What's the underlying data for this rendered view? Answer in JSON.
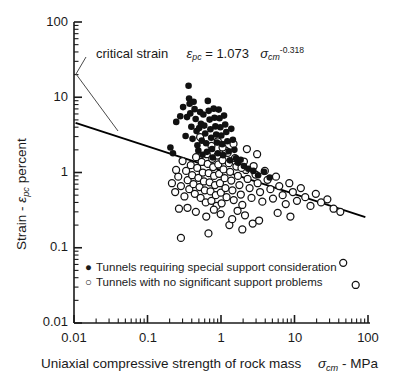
{
  "chart_data": {
    "type": "scatter",
    "title": "",
    "xlabel_parts": {
      "pre": "Uniaxial compressive strength of rock mass",
      "sym": "σ",
      "sub": "cm",
      "post": "- MPa"
    },
    "ylabel_parts": {
      "pre": "Strain -",
      "sym": "ε",
      "sub": "pc",
      "post": "percent"
    },
    "xscale": "log",
    "yscale": "log",
    "xlim": [
      0.01,
      100
    ],
    "ylim": [
      0.01,
      100
    ],
    "xticks": [
      0.01,
      0.1,
      1,
      10,
      100
    ],
    "xticklabels": [
      "0.01",
      "0.1",
      "1",
      "10",
      "100"
    ],
    "yticks": [
      0.01,
      0.1,
      1,
      10,
      100
    ],
    "yticklabels": [
      "0.01",
      "0.1",
      "1",
      "10",
      "100"
    ],
    "grid": false,
    "minor_ticks": true,
    "tick_direction": "in",
    "legend_position": "bottom-left",
    "annotation": {
      "label": "critical strain",
      "equation": {
        "lhs_sym": "ε",
        "lhs_sub": "pc",
        "eq": "=",
        "coef": "1.073",
        "var_sym": "σ",
        "var_sub": "cm",
        "exponent": "-0.318"
      },
      "leader": [
        [
          86,
          57
        ],
        [
          76,
          74
        ],
        [
          118,
          131
        ]
      ]
    },
    "fit_line": {
      "name": "critical strain curve",
      "formula": "eps_pc = 1.073 * sigma_cm^-0.318",
      "coefficient": 1.073,
      "exponent": -0.318,
      "x_start": 0.0105,
      "x_end": 92
    },
    "series": [
      {
        "name": "Tunnels requiring special support consideration",
        "marker": "filled-circle",
        "color": "#111111",
        "points": [
          [
            0.205,
            2.15
          ],
          [
            0.222,
            1.8
          ],
          [
            0.246,
            4.7
          ],
          [
            0.279,
            5.6
          ],
          [
            0.305,
            7.4
          ],
          [
            0.33,
            3.05
          ],
          [
            0.345,
            5.45
          ],
          [
            0.362,
            14.2
          ],
          [
            0.368,
            9.6
          ],
          [
            0.374,
            8.2
          ],
          [
            0.382,
            6.1
          ],
          [
            0.395,
            4.05
          ],
          [
            0.41,
            2.8
          ],
          [
            0.424,
            8.7
          ],
          [
            0.437,
            6.95
          ],
          [
            0.452,
            5.15
          ],
          [
            0.465,
            3.55
          ],
          [
            0.478,
            2.3
          ],
          [
            0.492,
            1.95
          ],
          [
            0.505,
            3.9
          ],
          [
            0.52,
            6.35
          ],
          [
            0.534,
            4.45
          ],
          [
            0.548,
            2.65
          ],
          [
            0.56,
            1.72
          ],
          [
            0.575,
            5.9
          ],
          [
            0.592,
            4.2
          ],
          [
            0.61,
            3.3
          ],
          [
            0.628,
            2.45
          ],
          [
            0.645,
            1.88
          ],
          [
            0.662,
            8.95
          ],
          [
            0.68,
            6.6
          ],
          [
            0.7,
            5.05
          ],
          [
            0.718,
            3.75
          ],
          [
            0.735,
            2.9
          ],
          [
            0.755,
            2.05
          ],
          [
            0.772,
            1.58
          ],
          [
            0.795,
            7.05
          ],
          [
            0.815,
            5.35
          ],
          [
            0.838,
            4.1
          ],
          [
            0.86,
            3.2
          ],
          [
            0.882,
            2.5
          ],
          [
            0.905,
            1.8
          ],
          [
            0.93,
            6.85
          ],
          [
            0.955,
            5.25
          ],
          [
            0.98,
            4.0
          ],
          [
            1.01,
            3.1
          ],
          [
            1.04,
            2.38
          ],
          [
            1.07,
            1.7
          ],
          [
            1.1,
            5.7
          ],
          [
            1.14,
            4.35
          ],
          [
            1.18,
            3.45
          ],
          [
            1.22,
            2.6
          ],
          [
            1.27,
            1.92
          ],
          [
            1.32,
            1.45
          ],
          [
            1.38,
            3.8
          ],
          [
            1.45,
            2.72
          ],
          [
            1.52,
            2.0
          ],
          [
            1.6,
            1.55
          ],
          [
            1.7,
            1.35
          ],
          [
            1.85,
            1.48
          ],
          [
            2.05,
            1.22
          ],
          [
            2.35,
            1.12
          ],
          [
            2.75,
            1.05
          ],
          [
            3.2,
            0.92
          ],
          [
            3.85,
            1.02
          ],
          [
            4.6,
            0.86
          ]
        ]
      },
      {
        "name": "Tunnels with no significant support problems",
        "marker": "open-circle",
        "color": "#111111",
        "points": [
          [
            0.215,
            0.72
          ],
          [
            0.238,
            0.55
          ],
          [
            0.262,
            0.88
          ],
          [
            0.285,
            0.66
          ],
          [
            0.3,
            1.42
          ],
          [
            0.318,
            0.48
          ],
          [
            0.335,
            1.05
          ],
          [
            0.352,
            0.79
          ],
          [
            0.37,
            0.6
          ],
          [
            0.388,
            1.25
          ],
          [
            0.405,
            0.92
          ],
          [
            0.422,
            0.7
          ],
          [
            0.44,
            0.52
          ],
          [
            0.458,
            1.6
          ],
          [
            0.475,
            1.15
          ],
          [
            0.492,
            0.85
          ],
          [
            0.51,
            0.64
          ],
          [
            0.528,
            0.46
          ],
          [
            0.545,
            1.38
          ],
          [
            0.565,
            1.0
          ],
          [
            0.585,
            0.76
          ],
          [
            0.602,
            0.58
          ],
          [
            0.62,
            0.4
          ],
          [
            0.64,
            1.75
          ],
          [
            0.66,
            1.3
          ],
          [
            0.68,
            0.98
          ],
          [
            0.7,
            0.74
          ],
          [
            0.72,
            0.56
          ],
          [
            0.74,
            0.42
          ],
          [
            0.76,
            1.52
          ],
          [
            0.782,
            1.18
          ],
          [
            0.805,
            0.9
          ],
          [
            0.828,
            0.68
          ],
          [
            0.85,
            0.5
          ],
          [
            0.872,
            0.36
          ],
          [
            0.895,
            1.68
          ],
          [
            0.918,
            1.28
          ],
          [
            0.942,
            0.96
          ],
          [
            0.968,
            0.72
          ],
          [
            0.995,
            0.54
          ],
          [
            1.02,
            0.39
          ],
          [
            1.05,
            1.45
          ],
          [
            1.08,
            1.1
          ],
          [
            1.12,
            0.84
          ],
          [
            1.15,
            0.62
          ],
          [
            1.19,
            0.47
          ],
          [
            1.23,
            1.82
          ],
          [
            1.28,
            1.33
          ],
          [
            1.33,
            1.02
          ],
          [
            1.38,
            0.78
          ],
          [
            1.43,
            0.58
          ],
          [
            1.49,
            0.43
          ],
          [
            1.55,
            1.55
          ],
          [
            1.62,
            1.2
          ],
          [
            1.7,
            0.9
          ],
          [
            1.78,
            0.68
          ],
          [
            1.86,
            0.51
          ],
          [
            1.95,
            0.37
          ],
          [
            2.05,
            1.4
          ],
          [
            2.18,
            1.08
          ],
          [
            2.3,
            0.82
          ],
          [
            2.45,
            0.62
          ],
          [
            2.6,
            0.46
          ],
          [
            2.78,
            1.22
          ],
          [
            2.95,
            0.94
          ],
          [
            3.15,
            0.72
          ],
          [
            3.4,
            0.55
          ],
          [
            3.65,
            0.41
          ],
          [
            3.95,
            1.05
          ],
          [
            4.3,
            0.8
          ],
          [
            4.7,
            0.6
          ],
          [
            5.1,
            0.45
          ],
          [
            5.6,
            0.88
          ],
          [
            6.2,
            0.66
          ],
          [
            6.9,
            0.5
          ],
          [
            7.6,
            0.38
          ],
          [
            8.5,
            0.72
          ],
          [
            9.5,
            0.55
          ],
          [
            10.8,
            0.42
          ],
          [
            12.2,
            0.62
          ],
          [
            14.0,
            0.47
          ],
          [
            16.5,
            0.36
          ],
          [
            19.5,
            0.52
          ],
          [
            23.0,
            0.4
          ],
          [
            28.0,
            0.44
          ],
          [
            34.0,
            0.33
          ],
          [
            42.0,
            0.3
          ],
          [
            0.52,
            2.95
          ],
          [
            0.742,
            2.25
          ],
          [
            0.905,
            2.6
          ],
          [
            1.16,
            1.95
          ],
          [
            1.48,
            2.4
          ],
          [
            2.25,
            2.05
          ],
          [
            3.1,
            1.75
          ],
          [
            0.285,
            0.135
          ],
          [
            0.675,
            0.155
          ],
          [
            1.3,
            0.2
          ],
          [
            1.95,
            0.175
          ],
          [
            2.7,
            0.21
          ],
          [
            46.0,
            0.063
          ],
          [
            68.0,
            0.032
          ],
          [
            0.455,
            0.3
          ],
          [
            0.63,
            0.26
          ],
          [
            0.99,
            0.28
          ],
          [
            1.42,
            0.24
          ],
          [
            2.12,
            0.27
          ],
          [
            3.3,
            0.23
          ],
          [
            0.35,
            0.34
          ],
          [
            0.8,
            0.32
          ],
          [
            1.68,
            0.31
          ],
          [
            5.9,
            0.29
          ],
          [
            8.8,
            0.26
          ],
          [
            0.245,
            1.08
          ],
          [
            0.268,
            0.33
          ],
          [
            1.05,
            2.15
          ],
          [
            1.9,
            1.15
          ]
        ]
      }
    ]
  },
  "legend": {
    "items": [
      {
        "marker": "●",
        "label": "Tunnels requiring special support consideration"
      },
      {
        "marker": "○",
        "label": "Tunnels with no significant support problems"
      }
    ]
  },
  "axis": {
    "x_title_pre": "Uniaxial compressive strength of rock mass",
    "x_title_sym": "σ",
    "x_title_sub": "cm",
    "x_title_post": "- MPa",
    "y_title_pre": "Strain -",
    "y_title_sym": "ε",
    "y_title_sub": "pc",
    "y_title_post": "percent",
    "x_labels": [
      "0.01",
      "0.1",
      "1",
      "10",
      "100"
    ],
    "y_labels": [
      "100",
      "10",
      "1",
      "0.1",
      "0.01"
    ]
  },
  "annotation_text": {
    "critical_strain": "critical strain",
    "eps": "ε",
    "eps_sub": "pc",
    "equals": "= 1.073",
    "sigma": "σ",
    "sigma_sub": "cm",
    "exponent": "-0.318"
  },
  "colors": {
    "axis": "#1a1a1a",
    "marker_fill": "#111111",
    "marker_open": "#ffffff",
    "line": "#000000"
  }
}
